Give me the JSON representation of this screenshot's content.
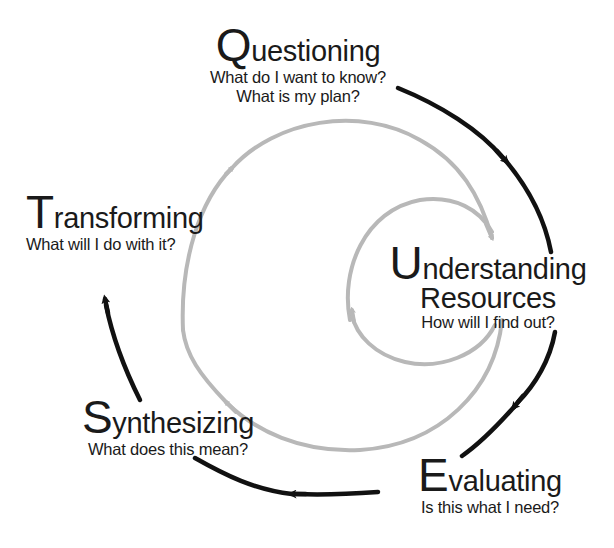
{
  "diagram": {
    "type": "cycle",
    "colors": {
      "outer_arrows": "#111111",
      "inner_spiral": "#b8b8b8",
      "text": "#1a1a1a",
      "background": "#ffffff"
    },
    "stages": [
      {
        "id": "questioning",
        "initial": "Q",
        "rest": "uestioning",
        "questions": [
          "What do I want to know?",
          "What is my plan?"
        ]
      },
      {
        "id": "understanding",
        "initial": "U",
        "rest": "nderstanding",
        "line2": "Resources",
        "questions": [
          "How will I find out?"
        ]
      },
      {
        "id": "evaluating",
        "initial": "E",
        "rest": "valuating",
        "questions": [
          "Is this what I need?"
        ]
      },
      {
        "id": "synthesizing",
        "initial": "S",
        "rest": "ynthesizing",
        "questions": [
          "What does this mean?"
        ]
      },
      {
        "id": "transforming",
        "initial": "T",
        "rest": "ransforming",
        "questions": [
          "What will I do with it?"
        ]
      }
    ],
    "icons": {
      "outer_cycle": "black-clockwise-arrows",
      "inner_spiral": "gray-spiral-arrows"
    }
  }
}
